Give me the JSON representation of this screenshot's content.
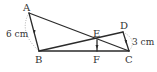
{
  "diagram": {
    "points": {
      "A": {
        "label": "A",
        "x": 29,
        "y": 13
      },
      "B": {
        "label": "B",
        "x": 39,
        "y": 51
      },
      "C": {
        "label": "C",
        "x": 129,
        "y": 51
      },
      "D": {
        "label": "D",
        "x": 123,
        "y": 32
      },
      "E": {
        "label": "E",
        "x": 97,
        "y": 40
      },
      "F": {
        "label": "F",
        "x": 97,
        "y": 51
      }
    },
    "segments": [
      "AB",
      "BC",
      "CD",
      "AC",
      "BD",
      "EF"
    ],
    "measurements": {
      "AB": "6 cm",
      "DC": "3 cm"
    },
    "colors": {
      "line": "#2b2b2b",
      "text": "#333333",
      "dotted": "#999999"
    }
  }
}
